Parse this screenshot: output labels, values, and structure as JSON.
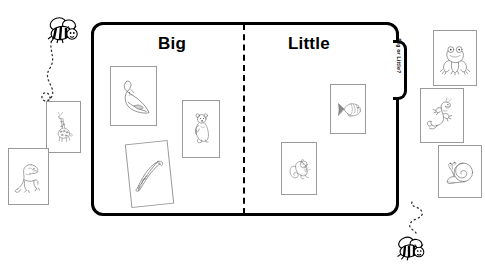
{
  "page": {
    "top_cut_text": "",
    "background_color": "#ffffff",
    "ink_color": "#000000"
  },
  "board": {
    "name": "big-or-little-sorting-board",
    "tab_label": "Big or Little?",
    "divider": "dashed-vertical-divider",
    "columns": [
      {
        "id": "big",
        "label": "Big"
      },
      {
        "id": "little",
        "label": "Little"
      }
    ]
  },
  "cards": {
    "unsorted_left": [
      {
        "id": "giraffe",
        "animal": "giraffe",
        "icon": "giraffe-icon",
        "x": 46,
        "y": 101,
        "w": 35,
        "h": 52,
        "rot": 0
      },
      {
        "id": "dinosaur",
        "animal": "dinosaur",
        "icon": "dinosaur-icon",
        "x": 8,
        "y": 148,
        "w": 41,
        "h": 57,
        "rot": 0
      }
    ],
    "column_big": [
      {
        "id": "whale",
        "animal": "whale",
        "icon": "whale-icon",
        "x": 110,
        "y": 66,
        "w": 47,
        "h": 60,
        "rot": 0
      },
      {
        "id": "bear",
        "animal": "bear",
        "icon": "bear-icon",
        "x": 182,
        "y": 100,
        "w": 38,
        "h": 58,
        "rot": 0
      },
      {
        "id": "alligator",
        "animal": "alligator",
        "icon": "alligator-icon",
        "x": 128,
        "y": 142,
        "w": 43,
        "h": 64,
        "rot": -6
      }
    ],
    "column_little": [
      {
        "id": "fish",
        "animal": "fish",
        "icon": "fish-icon",
        "x": 330,
        "y": 84,
        "w": 36,
        "h": 50,
        "rot": 0
      },
      {
        "id": "squirrel",
        "animal": "squirrel",
        "icon": "squirrel-icon",
        "x": 281,
        "y": 142,
        "w": 36,
        "h": 53,
        "rot": 0
      }
    ],
    "unsorted_right": [
      {
        "id": "frog",
        "animal": "frog",
        "icon": "frog-icon",
        "x": 433,
        "y": 30,
        "w": 44,
        "h": 56,
        "rot": 0
      },
      {
        "id": "lizard",
        "animal": "lizard",
        "icon": "lizard-icon",
        "x": 420,
        "y": 88,
        "w": 44,
        "h": 55,
        "rot": 0
      },
      {
        "id": "snail",
        "animal": "snail",
        "icon": "snail-icon",
        "x": 438,
        "y": 145,
        "w": 44,
        "h": 53,
        "rot": 0
      }
    ]
  },
  "decorations": [
    {
      "id": "bee-top-left",
      "icon": "bee-icon",
      "trail": "dotted-trail"
    },
    {
      "id": "bee-bottom-right",
      "icon": "bee-icon",
      "trail": "dotted-trail"
    }
  ]
}
